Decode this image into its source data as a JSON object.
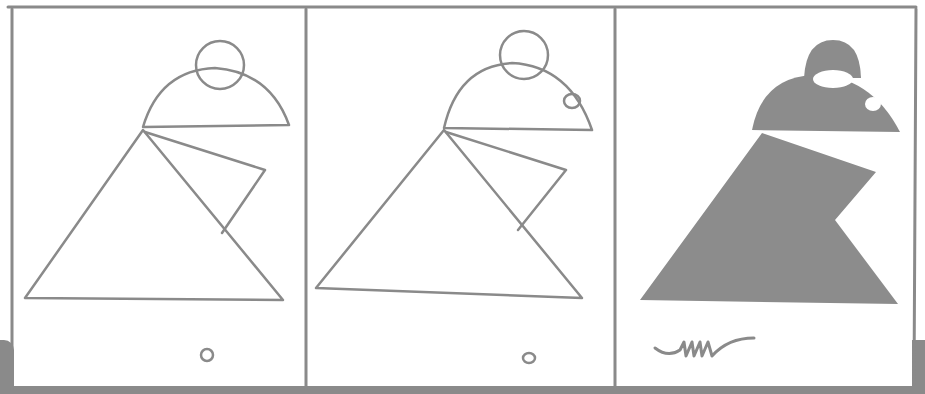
{
  "comic": {
    "panel_count": 3,
    "panels": [
      {
        "index": 1,
        "description": "outline drawing: circle over semicircle head on triangle body with flap",
        "footer_mark": "small circle"
      },
      {
        "index": 2,
        "description": "outline drawing with added eye circle on head",
        "footer_mark": "small circle"
      },
      {
        "index": 3,
        "description": "filled silhouette of creature",
        "footer_mark": "signature scribble"
      }
    ],
    "signature_text": "mmr",
    "colors": {
      "ink": "#8a8a8a",
      "fill": "#8c8c8c",
      "paper": "#ffffff",
      "shadow": "#8a8a8a"
    }
  }
}
